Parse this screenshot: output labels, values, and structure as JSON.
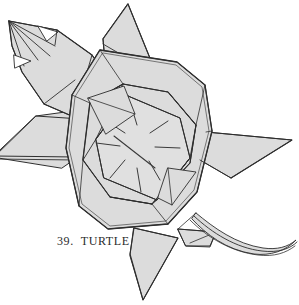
{
  "figure": {
    "caption": "39.  TURTLE",
    "caption_number": "39.",
    "caption_title": "TURTLE",
    "style": "line-drawing-with-flat-gray-fill"
  },
  "colors": {
    "background": "#ffffff",
    "paper_fill": "#dcdcdc",
    "paper_fill_light": "#e4e4e4",
    "paper_fill_dark": "#d2d2d2",
    "fold_line": "#2e2e2e",
    "crease_line": "#3a3a3a",
    "caption_text": "#2b2b2b"
  },
  "parts": {
    "head": "head",
    "shell_outer": "shell-outer",
    "shell_inner": "shell-inner",
    "shell_center": "shell-center-panel",
    "starburst": "shell-starburst-creases",
    "flipper_front_left": "front-left-flipper",
    "flipper_front_right": "front-right-flipper",
    "flipper_rear_left": "rear-left-flipper",
    "flipper_rear_right": "rear-right-flipper",
    "tail": "tail"
  },
  "counts": {
    "starburst_creases": 8,
    "flippers": 4
  }
}
